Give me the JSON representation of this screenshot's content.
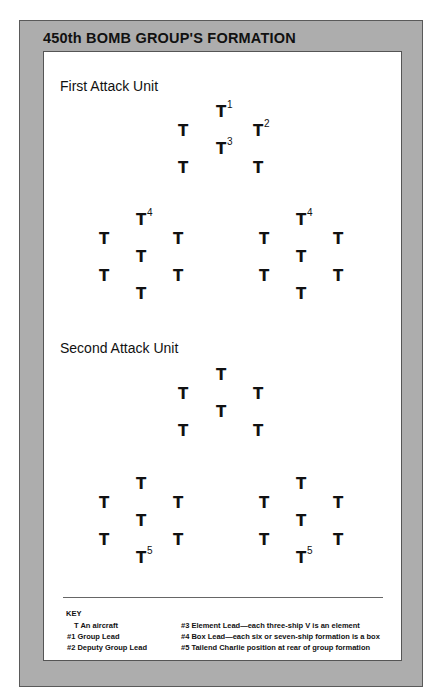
{
  "title": "450th BOMB GROUP'S FORMATION",
  "units": [
    {
      "label": "First Attack Unit",
      "lead_element": [
        {
          "glyph": "T",
          "mark": "1"
        },
        {
          "glyph": "T",
          "mark": ""
        },
        {
          "glyph": "T",
          "mark": "2"
        },
        {
          "glyph": "T",
          "mark": "3"
        },
        {
          "glyph": "T",
          "mark": ""
        },
        {
          "glyph": "T",
          "mark": ""
        }
      ],
      "boxes": [
        [
          {
            "glyph": "T",
            "mark": "4"
          },
          {
            "glyph": "T",
            "mark": ""
          },
          {
            "glyph": "T",
            "mark": ""
          },
          {
            "glyph": "T",
            "mark": ""
          },
          {
            "glyph": "T",
            "mark": ""
          },
          {
            "glyph": "T",
            "mark": ""
          },
          {
            "glyph": "T",
            "mark": ""
          }
        ],
        [
          {
            "glyph": "T",
            "mark": "4"
          },
          {
            "glyph": "T",
            "mark": ""
          },
          {
            "glyph": "T",
            "mark": ""
          },
          {
            "glyph": "T",
            "mark": ""
          },
          {
            "glyph": "T",
            "mark": ""
          },
          {
            "glyph": "T",
            "mark": ""
          },
          {
            "glyph": "T",
            "mark": ""
          }
        ]
      ]
    },
    {
      "label": "Second Attack Unit",
      "lead_element": [
        {
          "glyph": "T",
          "mark": ""
        },
        {
          "glyph": "T",
          "mark": ""
        },
        {
          "glyph": "T",
          "mark": ""
        },
        {
          "glyph": "T",
          "mark": ""
        },
        {
          "glyph": "T",
          "mark": ""
        },
        {
          "glyph": "T",
          "mark": ""
        }
      ],
      "boxes": [
        [
          {
            "glyph": "T",
            "mark": ""
          },
          {
            "glyph": "T",
            "mark": ""
          },
          {
            "glyph": "T",
            "mark": ""
          },
          {
            "glyph": "T",
            "mark": ""
          },
          {
            "glyph": "T",
            "mark": ""
          },
          {
            "glyph": "T",
            "mark": ""
          },
          {
            "glyph": "T",
            "mark": "5"
          }
        ],
        [
          {
            "glyph": "T",
            "mark": ""
          },
          {
            "glyph": "T",
            "mark": ""
          },
          {
            "glyph": "T",
            "mark": ""
          },
          {
            "glyph": "T",
            "mark": ""
          },
          {
            "glyph": "T",
            "mark": ""
          },
          {
            "glyph": "T",
            "mark": ""
          },
          {
            "glyph": "T",
            "mark": "5"
          }
        ]
      ]
    }
  ],
  "key": {
    "heading": "KEY",
    "left": [
      "T An aircraft",
      "#1 Group Lead",
      "#2 Deputy Group Lead"
    ],
    "right": [
      "#3 Element Lead—each three-ship V is an element",
      "#4 Box Lead—each six or seven-ship formation is a box",
      "#5 Tailend Charlie position at rear of group formation"
    ]
  }
}
